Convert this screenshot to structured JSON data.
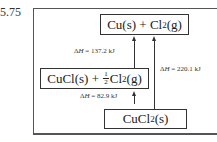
{
  "problem_number": "5.75",
  "species": {
    "top": {
      "text_main": "Cu(s) + Cl",
      "subscript": "2",
      "suffix": "(g)"
    },
    "middle": {
      "prefix": "CuCl(s) + ",
      "frac_num": "1",
      "frac_den": "2",
      "main": "Cl",
      "subscript": "2",
      "suffix": "(g)"
    },
    "bottom": {
      "main": "CuCl",
      "subscript": "2",
      "suffix": "(s)"
    }
  },
  "enthalpies": {
    "step1": {
      "symbol": "Δ",
      "var": "H",
      "value": " = 137.2 kJ",
      "from": "CuCl(s) + 1/2 Cl2(g)",
      "to": "Cu(s) + Cl2(g)"
    },
    "step2": {
      "symbol": "Δ",
      "var": "H",
      "value": " = 82.9 kJ",
      "from": "CuCl2(s)",
      "to": "CuCl(s) + 1/2 Cl2(g)"
    },
    "overall": {
      "symbol": "Δ",
      "var": "H",
      "value": " = 220.1 kJ",
      "from": "CuCl2(s)",
      "to": "Cu(s) + Cl2(g)"
    }
  }
}
